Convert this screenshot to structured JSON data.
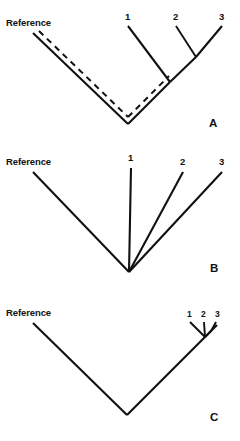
{
  "figure": {
    "type": "phylogenetic-tree-diagram",
    "panel_count": 3,
    "background_color": "#ffffff",
    "line_color": "#111111"
  },
  "panels": [
    {
      "id": "A",
      "label": "A",
      "reference_label": "Reference",
      "tip_labels": [
        "1",
        "2",
        "3"
      ],
      "topology": "asymmetric-ladder",
      "has_dashed_overlay": true,
      "dashed_meaning": "alternate-reference-lineage"
    },
    {
      "id": "B",
      "label": "B",
      "reference_label": "Reference",
      "tip_labels": [
        "1",
        "2",
        "3"
      ],
      "topology": "star-polytomy",
      "has_dashed_overlay": false
    },
    {
      "id": "C",
      "label": "C",
      "reference_label": "Reference",
      "tip_labels": [
        "1",
        "2",
        "3"
      ],
      "topology": "tight-terminal-cluster",
      "has_dashed_overlay": false
    }
  ]
}
